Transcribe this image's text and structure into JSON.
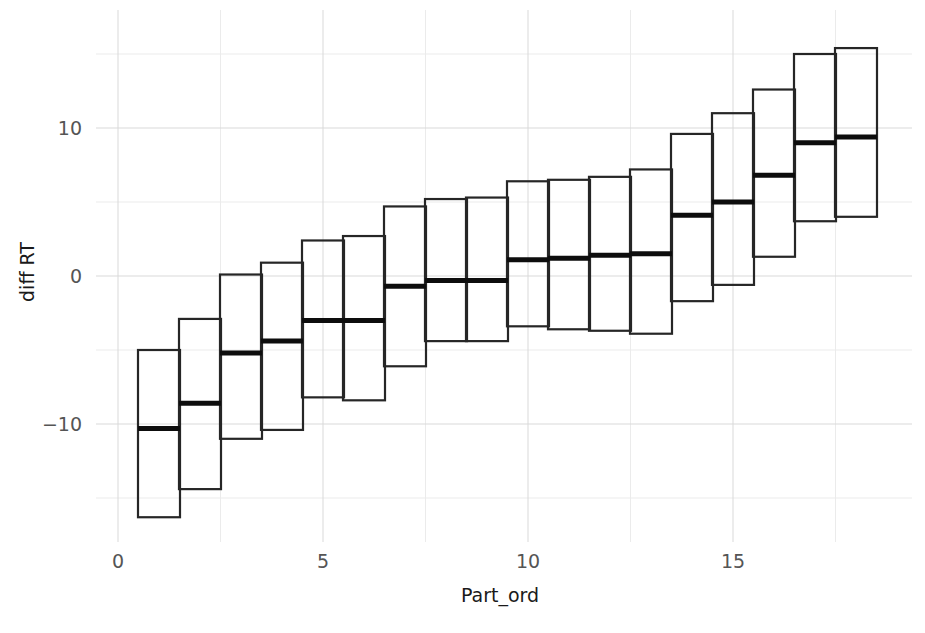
{
  "chart_data": {
    "type": "bar",
    "subtype": "boxplot-style interval bars (min/median/max per participant)",
    "title": "",
    "xlabel": "Part_ord",
    "ylabel": "diff RT",
    "grid": true,
    "legend": null,
    "xlim": [
      0.3,
      18.7
    ],
    "ylim": [
      -17.5,
      16.5
    ],
    "xticks": [
      0,
      5,
      10,
      15
    ],
    "xtick_labels": [
      "0",
      "5",
      "10",
      "15"
    ],
    "yticks": [
      -10,
      0,
      10
    ],
    "ytick_labels": [
      "−10",
      "0",
      "10"
    ],
    "x_minor_gridlines": [
      2.5,
      7.5,
      12.5,
      17.5
    ],
    "y_minor_gridlines": [
      -15,
      -5,
      5,
      15
    ],
    "categories": [
      1,
      2,
      3,
      4,
      5,
      6,
      7,
      8,
      9,
      10,
      11,
      12,
      13,
      14,
      15,
      16,
      17,
      18
    ],
    "series": [
      {
        "name": "upper",
        "values": [
          -5.0,
          -2.9,
          0.1,
          0.9,
          2.4,
          2.7,
          4.7,
          5.2,
          5.3,
          6.4,
          6.5,
          6.7,
          7.2,
          9.6,
          11.0,
          12.6,
          15.0,
          15.4
        ]
      },
      {
        "name": "median",
        "values": [
          -10.3,
          -8.6,
          -5.2,
          -4.4,
          -3.0,
          -3.0,
          -0.7,
          -0.3,
          -0.3,
          1.1,
          1.2,
          1.4,
          1.5,
          4.1,
          5.0,
          6.8,
          9.0,
          9.4
        ]
      },
      {
        "name": "lower",
        "values": [
          -16.3,
          -14.4,
          -11.0,
          -10.4,
          -8.2,
          -8.4,
          -6.1,
          -4.4,
          -4.4,
          -3.4,
          -3.6,
          -3.7,
          -3.9,
          -1.7,
          -0.6,
          1.3,
          3.7,
          4.0
        ]
      }
    ],
    "boxes": [
      {
        "x": 1,
        "upper": -5.0,
        "median": -10.3,
        "lower": -16.3
      },
      {
        "x": 2,
        "upper": -2.9,
        "median": -8.6,
        "lower": -14.4
      },
      {
        "x": 3,
        "upper": 0.1,
        "median": -5.2,
        "lower": -11.0
      },
      {
        "x": 4,
        "upper": 0.9,
        "median": -4.4,
        "lower": -10.4
      },
      {
        "x": 5,
        "upper": 2.4,
        "median": -3.0,
        "lower": -8.2
      },
      {
        "x": 6,
        "upper": 2.7,
        "median": -3.0,
        "lower": -8.4
      },
      {
        "x": 7,
        "upper": 4.7,
        "median": -0.7,
        "lower": -6.1
      },
      {
        "x": 8,
        "upper": 5.2,
        "median": -0.3,
        "lower": -4.4
      },
      {
        "x": 9,
        "upper": 5.3,
        "median": -0.3,
        "lower": -4.4
      },
      {
        "x": 10,
        "upper": 6.4,
        "median": 1.1,
        "lower": -3.4
      },
      {
        "x": 11,
        "upper": 6.5,
        "median": 1.2,
        "lower": -3.6
      },
      {
        "x": 12,
        "upper": 6.7,
        "median": 1.4,
        "lower": -3.7
      },
      {
        "x": 13,
        "upper": 7.2,
        "median": 1.5,
        "lower": -3.9
      },
      {
        "x": 14,
        "upper": 9.6,
        "median": 4.1,
        "lower": -1.7
      },
      {
        "x": 15,
        "upper": 11.0,
        "median": 5.0,
        "lower": -0.6
      },
      {
        "x": 16,
        "upper": 12.6,
        "median": 6.8,
        "lower": 1.3
      },
      {
        "x": 17,
        "upper": 15.0,
        "median": 9.0,
        "lower": 3.7
      },
      {
        "x": 18,
        "upper": 15.4,
        "median": 9.4,
        "lower": 4.0
      }
    ],
    "colors": {
      "background": "#ffffff",
      "box_stroke": "#262626",
      "median_stroke": "#0d0d0d",
      "gridline_major": "#d9d9d9",
      "gridline_minor": "#ebebeb",
      "tick_label": "#555555",
      "axis_title": "#1a1a1a"
    }
  }
}
